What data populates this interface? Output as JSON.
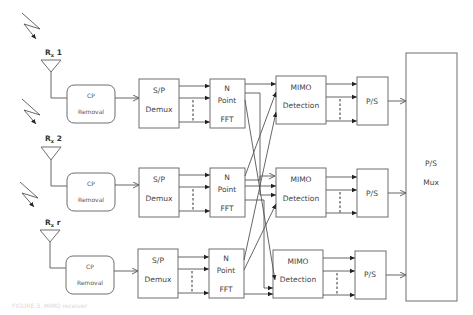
{
  "diagram": {
    "type": "MIMO-OFDM receiver block diagram",
    "antennas": [
      {
        "label": "Rx 1",
        "base": "R",
        "sub": "x",
        "suffix": " 1"
      },
      {
        "label": "Rx 2",
        "base": "R",
        "sub": "x",
        "suffix": " 2"
      },
      {
        "label": "Rx r",
        "base": "R",
        "sub": "x",
        "suffix": " r"
      }
    ],
    "rows": [
      {
        "cp": {
          "line1": "CP",
          "line2": "Removal"
        },
        "sp": {
          "line1": "S/P",
          "line2": "Demux"
        },
        "fft": {
          "line1": "N",
          "line2": "Point",
          "line3": "FFT"
        },
        "mimo": {
          "line1": "MIMO",
          "line2": "Detection"
        },
        "ps": {
          "line1": "P/S"
        }
      },
      {
        "cp": {
          "line1": "CP",
          "line2": "Removal"
        },
        "sp": {
          "line1": "S/P",
          "line2": "Demux"
        },
        "fft": {
          "line1": "N",
          "line2": "Point",
          "line3": "FFT"
        },
        "mimo": {
          "line1": "MIMO",
          "line2": "Detection"
        },
        "ps": {
          "line1": "P/S"
        }
      },
      {
        "cp": {
          "line1": "CP",
          "line2": "Removal"
        },
        "sp": {
          "line1": "S/P",
          "line2": "Demux"
        },
        "fft": {
          "line1": "N",
          "line2": "Point",
          "line3": "FFT"
        },
        "mimo": {
          "line1": "MIMO",
          "line2": "Detection"
        },
        "ps": {
          "line1": "P/S"
        }
      }
    ],
    "mux": {
      "line1": "P/S",
      "line2": "Mux"
    },
    "caption": "FIGURE 3. MIMO receiver"
  }
}
